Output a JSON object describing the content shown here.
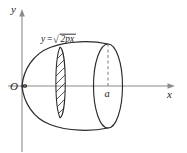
{
  "figure": {
    "background_color": "#ffffff",
    "stroke_color": "#2b2b2b",
    "axis_color": "#b0b0b0",
    "axes": {
      "y_axis_label": "y",
      "x_axis_label": "x",
      "origin_label": "O"
    },
    "annotations": {
      "curve_equation": {
        "lhs": "y",
        "equals": "=",
        "radical_symbol": "√",
        "radicand": "2px",
        "full_text": "y=√(2px)"
      },
      "x_mark_label": "a"
    },
    "elements": {
      "generating_curve": "y = sqrt(2px)",
      "solid": "paraboloid of revolution about x-axis",
      "right_cap": "ellipse end cap at x = a",
      "slice": "hatched vertical disc element",
      "dashed_segment": "radius from axis to top of end cap"
    }
  }
}
